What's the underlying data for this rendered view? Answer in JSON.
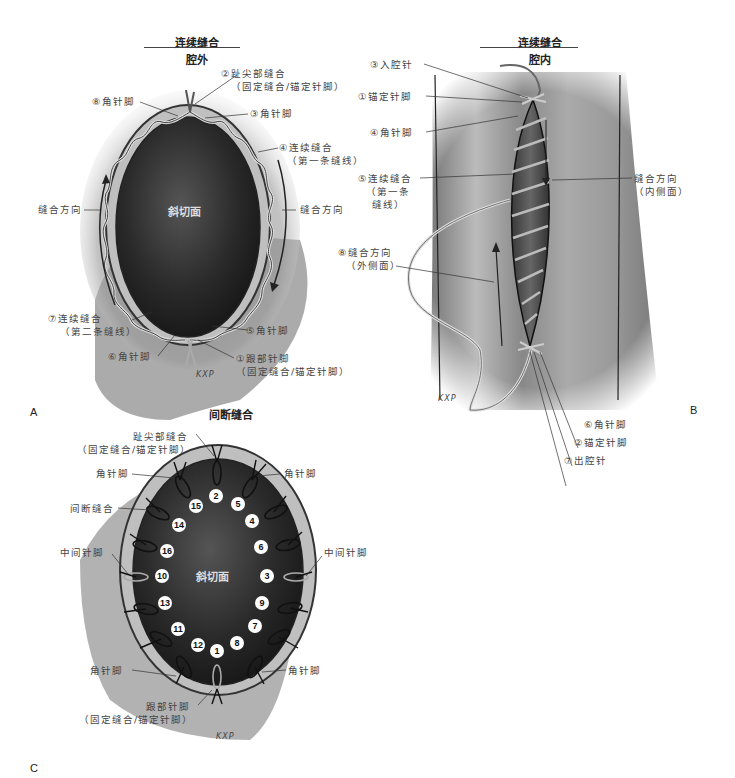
{
  "panels": {
    "A": {
      "letter": "A",
      "title": "连续缝合",
      "subtitle": "腔外",
      "center_label": "斜切面",
      "signature": "KXP",
      "labels": {
        "toe_suture_line1": "②趾尖部缝合",
        "toe_suture_line2": "（固定缝合/锚定针脚）",
        "corner_8": "⑧角针脚",
        "corner_3": "③角针脚",
        "continuous_first_line1": "④连续缝合",
        "continuous_first_line2": "（第一条缝线）",
        "direction_left": "缝合方向",
        "direction_right": "缝合方向",
        "continuous_second_line1": "⑦连续缝合",
        "continuous_second_line2": "（第二条缝线）",
        "corner_5": "⑤角针脚",
        "corner_6": "⑥角针脚",
        "heel_line1": "①跟部针脚",
        "heel_line2": "（固定缝合/锚定针脚）"
      }
    },
    "B": {
      "letter": "B",
      "title": "连续缝合",
      "subtitle": "腔内",
      "signature": "KXP",
      "labels": {
        "enter_lumen": "③入腔针",
        "anchor_1": "①锚定针脚",
        "corner_4": "④角针脚",
        "continuous_line1": "⑤连续缝合",
        "continuous_line2": "（第一条",
        "continuous_line3": "缝线）",
        "direction_inner_line1": "缝合方向",
        "direction_inner_line2": "（内侧面）",
        "direction_outer_line1": "⑧缝合方向",
        "direction_outer_line2": "（外侧面）",
        "corner_6": "⑥角针脚",
        "anchor_2": "②锚定针脚",
        "exit_lumen": "⑦出腔针"
      }
    },
    "C": {
      "letter": "C",
      "title": "间断缝合",
      "center_label": "斜切面",
      "signature": "KXP",
      "labels": {
        "toe_line1": "趾尖部缝合",
        "toe_line2": "（固定缝合/锚定针脚）",
        "corner_top_left": "角针脚",
        "corner_top_right": "角针脚",
        "interrupted": "间断缝合",
        "middle_left": "中间针脚",
        "middle_right": "中间针脚",
        "corner_bottom_left": "角针脚",
        "corner_bottom_right": "角针脚",
        "heel_line1": "跟部针脚",
        "heel_line2": "（固定缝合/锚定针脚）"
      },
      "stitch_numbers": [
        "2",
        "5",
        "15",
        "4",
        "14",
        "6",
        "16",
        "3",
        "10",
        "9",
        "13",
        "7",
        "11",
        "8",
        "12",
        "1"
      ]
    }
  }
}
